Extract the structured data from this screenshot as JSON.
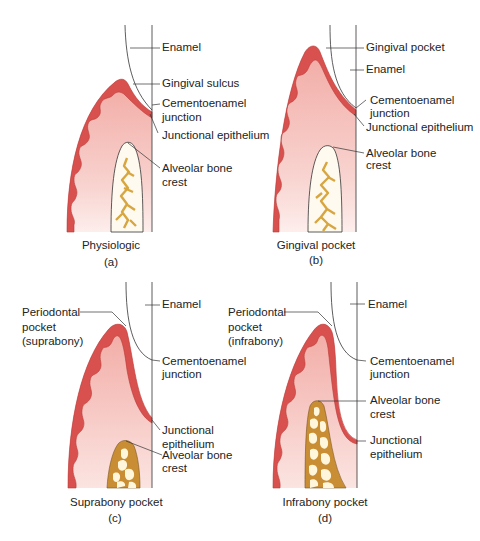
{
  "figure": {
    "colors": {
      "gingiva_epithelium": "#d9514f",
      "gingiva_connective_top": "#f3b3ad",
      "gingiva_connective_bottom": "#fbe6e3",
      "bone_outline": "#333333",
      "bone_fill_light": "#fff8e6",
      "bone_trabeculae": "#d8a640",
      "bone_fill_dark": "#c98d33",
      "line": "#333333"
    },
    "panels": [
      {
        "id": "a",
        "caption": "Physiologic",
        "letter": "(a)",
        "labels": {
          "enamel": "Enamel",
          "gingival_sulcus": "Gingival sulcus",
          "cej_1": "Cementoenamel",
          "cej_2": "junction",
          "junctional_epithelium": "Junctional epithelium",
          "alveolar_1": "Alveolar bone",
          "alveolar_2": "crest"
        }
      },
      {
        "id": "b",
        "caption": "Gingival pocket",
        "letter": "(b)",
        "labels": {
          "gingival_pocket": "Gingival pocket",
          "enamel": "Enamel",
          "cej_1": "Cementoenamel",
          "cej_2": "junction",
          "junctional_epithelium": "Junctional epithelium",
          "alveolar_1": "Alveolar bone",
          "alveolar_2": "crest"
        }
      },
      {
        "id": "c",
        "caption": "Suprabony pocket",
        "letter": "(c)",
        "labels": {
          "enamel": "Enamel",
          "pocket_1": "Periodontal",
          "pocket_2": "pocket",
          "pocket_3": "(suprabony)",
          "cej_1": "Cementoenamel",
          "cej_2": "junction",
          "je_1": "Junctional",
          "je_2": "epithelium",
          "alveolar_1": "Alveolar bone",
          "alveolar_2": "crest"
        }
      },
      {
        "id": "d",
        "caption": "Infrabony pocket",
        "letter": "(d)",
        "labels": {
          "enamel": "Enamel",
          "pocket_1": "Periodontal",
          "pocket_2": "pocket",
          "pocket_3": "(infrabony)",
          "cej_1": "Cementoenamel",
          "cej_2": "junction",
          "alveolar_1": "Alveolar bone",
          "alveolar_2": "crest",
          "je_1": "Junctional",
          "je_2": "epithelium"
        }
      }
    ]
  }
}
